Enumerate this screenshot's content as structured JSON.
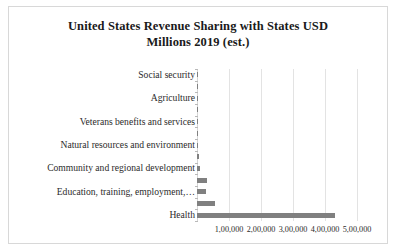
{
  "chart_data": {
    "type": "bar",
    "orientation": "horizontal",
    "title": "United States Revenue Sharing with States USD Millions 2019 (est.)",
    "title_line1": "United States Revenue Sharing with States USD",
    "title_line2": "Millions 2019 (est.)",
    "xlabel": "",
    "ylabel": "",
    "xlim": [
      0,
      500000
    ],
    "grid": true,
    "legend": false,
    "bar_color": "#808080",
    "categories": [
      "Social security",
      "Energy",
      "Agriculture",
      "Administration of justice",
      "Veterans benefits and services",
      "General government",
      "Natural resources and environment",
      "Transportation",
      "Community and regional development",
      "Income security",
      "Education, training, employment,…",
      "Medicaid",
      "Health"
    ],
    "values": [
      120,
      360,
      900,
      1500,
      2100,
      2800,
      3500,
      4800,
      9500,
      30000,
      29000,
      56000,
      430000
    ],
    "visible_tick_labels": [
      "Social security",
      "Agriculture",
      "Veterans benefits and services",
      "Natural resources and environment",
      "Community and regional development",
      "Education, training, employment,…",
      "Health"
    ],
    "xticks": [
      {
        "value": 100000,
        "label": "1,00,000"
      },
      {
        "value": 200000,
        "label": "2,00,000"
      },
      {
        "value": 300000,
        "label": "3,00,000"
      },
      {
        "value": 400000,
        "label": "4,00,000"
      },
      {
        "value": 500000,
        "label": "5,00,000"
      }
    ]
  }
}
